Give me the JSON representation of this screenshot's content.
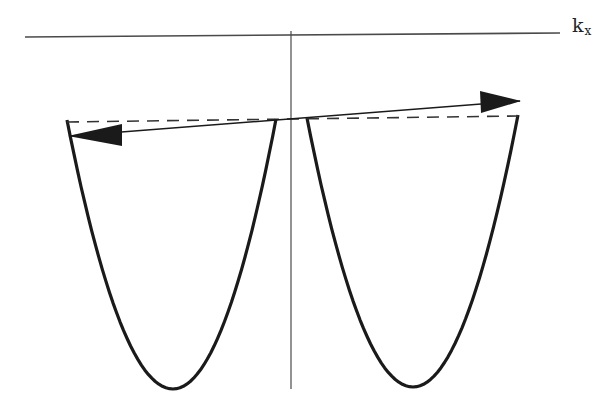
{
  "diagram": {
    "type": "band-structure-sketch",
    "axis_label": {
      "main": "k",
      "subscript": "x",
      "position": [
        572,
        32
      ]
    },
    "colors": {
      "background": "#ffffff",
      "curve": "#1a1a1a",
      "axis": "#4a4a4a",
      "dashed": "#333333",
      "arrow": "#1a1a1a"
    },
    "horizontal_axis": {
      "x1": 25,
      "y1": 37,
      "x2": 560,
      "y2": 33
    },
    "vertical_axis": {
      "x1": 291,
      "y1": 31,
      "x2": 291,
      "y2": 389
    },
    "parabolas": [
      {
        "name": "left-band",
        "top_left": [
          67,
          120
        ],
        "top_right": [
          276,
          119
        ],
        "bottom": [
          173,
          389
        ]
      },
      {
        "name": "right-band",
        "top_left": [
          307,
          118
        ],
        "top_right": [
          518,
          115
        ],
        "bottom": [
          413,
          387
        ]
      }
    ],
    "dashed_line": {
      "x1": 67,
      "y1": 122,
      "x2": 518,
      "y2": 116
    },
    "arrow_line": {
      "x1": 70,
      "y1": 136,
      "x2": 520,
      "y2": 101
    },
    "arrowheads": [
      {
        "direction": "left",
        "tip": [
          68,
          136
        ],
        "base_top": [
          122,
          124
        ],
        "base_bottom": [
          122,
          146
        ]
      },
      {
        "direction": "right",
        "tip": [
          521,
          101
        ],
        "base_top": [
          480,
          91
        ],
        "base_bottom": [
          481,
          113
        ]
      }
    ]
  }
}
